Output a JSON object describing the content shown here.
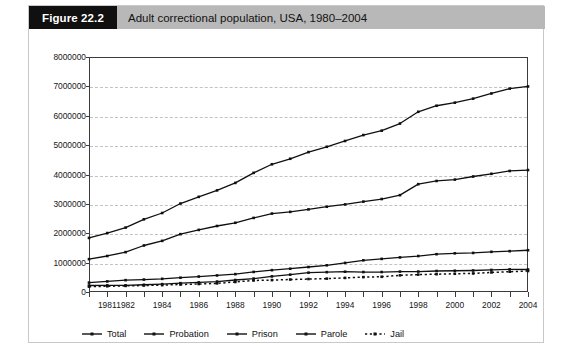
{
  "figure": {
    "number_label": "Figure 22.2",
    "caption": "Adult correctional population, USA, 1980–2004"
  },
  "legend": {
    "position": "bottom-left",
    "items": [
      {
        "label": "Total",
        "style": "solid-line-with-markers"
      },
      {
        "label": "Probation",
        "style": "solid-line-with-markers"
      },
      {
        "label": "Prison",
        "style": "solid-line-with-markers"
      },
      {
        "label": "Parole",
        "style": "solid-line-with-markers"
      },
      {
        "label": "Jail",
        "style": "dotted-line-with-markers"
      }
    ]
  },
  "axes": {
    "y_tick_labels": [
      "8000000",
      "7000000",
      "6000000",
      "5000000",
      "4000000",
      "3000000",
      "2000000",
      "1000000",
      "0"
    ],
    "x_tick_labels": [
      "1981",
      "1982",
      "1984",
      "1986",
      "1988",
      "1990",
      "1992",
      "1994",
      "1996",
      "1998",
      "2000",
      "2002",
      "2004"
    ]
  },
  "colors": {
    "series_line": "#101010",
    "frame": "#3b3b3b",
    "gridline": "#c2c2c2",
    "header_box": "#101010",
    "header_band": "#b8b8b8",
    "card_border": "#c9c9c9"
  },
  "chart_data": {
    "type": "line",
    "title": "Adult correctional population, USA, 1980–2004",
    "xlabel": "",
    "ylabel": "",
    "ylim": [
      0,
      8000000
    ],
    "ytick_interval": 1000000,
    "grid": true,
    "legend_position": "bottom-left",
    "x": [
      1980,
      1981,
      1982,
      1983,
      1984,
      1985,
      1986,
      1987,
      1988,
      1989,
      1990,
      1991,
      1992,
      1993,
      1994,
      1995,
      1996,
      1997,
      1998,
      1999,
      2000,
      2001,
      2002,
      2003,
      2004
    ],
    "xtick_values": [
      1981,
      1982,
      1984,
      1986,
      1988,
      1990,
      1992,
      1994,
      1996,
      1998,
      2000,
      2002,
      2004
    ],
    "series": [
      {
        "name": "Total",
        "values": [
          1840400,
          2006600,
          2192300,
          2475100,
          2689200,
          3011500,
          3239400,
          3459600,
          3714100,
          4055600,
          4348000,
          4535600,
          4762600,
          4944000,
          5141300,
          5342900,
          5490700,
          5734900,
          6134200,
          6340800,
          6445100,
          6581700,
          6758800,
          6924500,
          6996500
        ]
      },
      {
        "name": "Probation",
        "values": [
          1118097,
          1225934,
          1357264,
          1582947,
          1740948,
          1968712,
          2114621,
          2247158,
          2356483,
          2522125,
          2670234,
          2728472,
          2811611,
          2903061,
          2981022,
          3077861,
          3164996,
          3296513,
          3670441,
          3779922,
          3826209,
          3931731,
          4024067,
          4120012,
          4151125
        ]
      },
      {
        "name": "Prison",
        "values": [
          319598,
          360029,
          402914,
          423898,
          448264,
          487593,
          526436,
          562814,
          607766,
          683367,
          743382,
          792535,
          850566,
          909381,
          990147,
          1078542,
          1127528,
          1176564,
          1224469,
          1287172,
          1316333,
          1330007,
          1367547,
          1390279,
          1421911
        ]
      },
      {
        "name": "Parole",
        "values": [
          220438,
          225539,
          224604,
          246440,
          266992,
          300203,
          325638,
          355505,
          407977,
          456803,
          531407,
          590442,
          658601,
          676100,
          690371,
          679421,
          679733,
          694787,
          696385,
          714457,
          723898,
          732333,
          750934,
          769925,
          765355
        ]
      },
      {
        "name": "Jail",
        "values": [
          182288,
          195085,
          207853,
          221815,
          233018,
          254986,
          272735,
          294092,
          341893,
          393303,
          405320,
          424129,
          441781,
          455500,
          479800,
          507044,
          518492,
          567079,
          592462,
          605943,
          621149,
          631240,
          665475,
          691301,
          713990
        ]
      }
    ]
  }
}
